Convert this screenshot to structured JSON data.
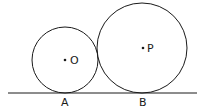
{
  "diagram": {
    "line": {
      "x1": 8,
      "y1": 93,
      "x2": 197,
      "y2": 93
    },
    "circles": [
      {
        "name": "O",
        "cx": 65,
        "cy": 60,
        "r": 33,
        "center_label": "O",
        "tangent_point_label": "A"
      },
      {
        "name": "P",
        "cx": 142,
        "cy": 48,
        "r": 45,
        "center_label": "P",
        "tangent_point_label": "B"
      }
    ],
    "labels": {
      "O": "O",
      "P": "P",
      "A": "A",
      "B": "B"
    },
    "stroke_color": "#1a1a1a",
    "background": "#ffffff"
  }
}
